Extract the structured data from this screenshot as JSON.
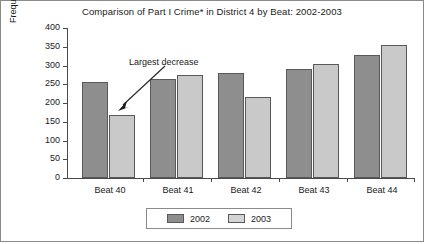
{
  "chart_data": {
    "type": "bar",
    "title": "Comparison of Part I Crime* in District 4 by Beat: 2002-2003",
    "xlabel": "",
    "ylabel": "Frequency of Part I Crime",
    "categories": [
      "Beat 40",
      "Beat 41",
      "Beat 42",
      "Beat 43",
      "Beat 44"
    ],
    "series": [
      {
        "name": "2002",
        "color": "#8e8e8e",
        "values": [
          256,
          264,
          280,
          291,
          328
        ]
      },
      {
        "name": "2003",
        "color": "#c9c9c9",
        "values": [
          168,
          275,
          216,
          304,
          355
        ]
      }
    ],
    "ylim": [
      0,
      400
    ],
    "yticks": [
      "0",
      "50",
      "100",
      "150",
      "200",
      "250",
      "300",
      "350",
      "400"
    ],
    "ytick_values": [
      0,
      50,
      100,
      150,
      200,
      250,
      300,
      350,
      400
    ],
    "grid": false,
    "legend_position": "bottom",
    "annotations": [
      {
        "text": "Largest decrease",
        "points_to": "Beat 40 / 2003 bar"
      }
    ]
  },
  "legend": {
    "items": [
      {
        "label": "2002"
      },
      {
        "label": "2003"
      }
    ]
  }
}
